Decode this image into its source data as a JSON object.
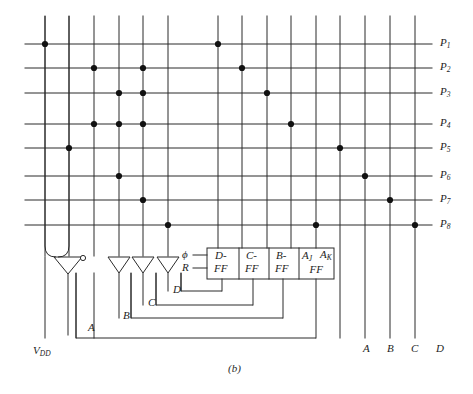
{
  "figure": {
    "caption": "(b)",
    "type": "pla-sequential-circuit-schematic"
  },
  "colors": {
    "line": "#2b2b2b",
    "dot": "#111111",
    "text": "#1d1d1d",
    "background": "#ffffff"
  },
  "geometry": {
    "columns_x": [
      45,
      69,
      94,
      119,
      143,
      168,
      218,
      242,
      267,
      291,
      316,
      340,
      365,
      390,
      415
    ],
    "rows_y": [
      44,
      68,
      93,
      124,
      148,
      176,
      200,
      225
    ],
    "grid_top": 16,
    "row_left": 25,
    "row_right": 432
  },
  "product_lines": [
    {
      "label": "P",
      "sub": "1",
      "y": 44,
      "dot_columns": [
        1,
        7
      ]
    },
    {
      "label": "P",
      "sub": "2",
      "y": 68,
      "dot_columns": [
        3,
        5,
        8
      ]
    },
    {
      "label": "P",
      "sub": "3",
      "y": 93,
      "dot_columns": [
        4,
        5,
        9
      ]
    },
    {
      "label": "P",
      "sub": "4",
      "y": 124,
      "dot_columns": [
        3,
        4,
        5,
        10
      ]
    },
    {
      "label": "P",
      "sub": "5",
      "y": 148,
      "dot_columns": [
        2,
        12
      ]
    },
    {
      "label": "P",
      "sub": "6",
      "y": 176,
      "dot_columns": [
        4,
        13
      ]
    },
    {
      "label": "P",
      "sub": "7",
      "y": 200,
      "dot_columns": [
        5,
        14
      ]
    },
    {
      "label": "P",
      "sub": "8",
      "y": 225,
      "dot_columns": [
        6,
        11,
        15
      ]
    }
  ],
  "flipflop_box": {
    "x": 207,
    "y": 248,
    "width": 127,
    "height": 31,
    "inputs": [
      {
        "name": "clock",
        "label": "ϕ",
        "y": 255
      },
      {
        "name": "reset",
        "label": "R",
        "y": 268
      }
    ],
    "cells": [
      {
        "name": "d-ff",
        "top": "D-",
        "bottom": "FF",
        "x": 207,
        "width": 30
      },
      {
        "name": "c-ff",
        "top": "C-",
        "bottom": "FF",
        "x": 239,
        "width": 28
      },
      {
        "name": "b-ff",
        "top": "B-",
        "bottom": "FF",
        "x": 269,
        "width": 28
      },
      {
        "name": "a-jk-ff",
        "top_left": "A",
        "top_left_sub": "J",
        "top_right": "A",
        "top_right_sub": "K",
        "bottom": "FF",
        "x": 299,
        "width": 35
      }
    ]
  },
  "inverters": [
    {
      "name": "vdd-inverter",
      "apex_x": 68,
      "has_bubble": true,
      "bubble_label": ""
    },
    {
      "name": "inverter-a",
      "apex_x": 119,
      "has_bubble": false
    },
    {
      "name": "inverter-b",
      "apex_x": 143,
      "has_bubble": false
    },
    {
      "name": "inverter-c",
      "apex_x": 168,
      "has_bubble": false
    }
  ],
  "feedback_labels": [
    {
      "name": "feedback-a",
      "text": "A",
      "x": 88,
      "y": 330
    },
    {
      "name": "feedback-b",
      "text": "B",
      "x": 123,
      "y": 318
    },
    {
      "name": "feedback-c",
      "text": "C",
      "x": 148,
      "y": 305
    },
    {
      "name": "feedback-d",
      "text": "D",
      "x": 173,
      "y": 292
    }
  ],
  "bottom_labels": [
    {
      "name": "supply-vdd",
      "text": "V",
      "sub": "DD",
      "x": 33,
      "y": 345
    },
    {
      "name": "output-a",
      "text": "A",
      "sub": "",
      "x": 363,
      "y": 343
    },
    {
      "name": "output-b",
      "text": "B",
      "sub": "",
      "x": 387,
      "y": 343
    },
    {
      "name": "output-c",
      "text": "C",
      "sub": "",
      "x": 411,
      "y": 343
    },
    {
      "name": "output-d",
      "text": "D",
      "sub": "",
      "x": 436,
      "y": 343
    }
  ]
}
